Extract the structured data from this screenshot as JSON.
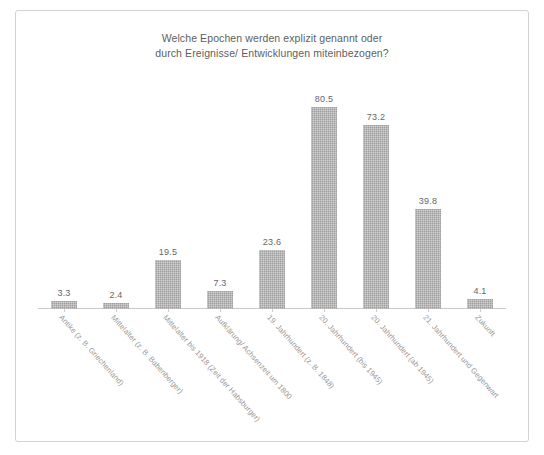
{
  "chart_data": {
    "type": "bar",
    "title": "Welche Epochen werden explizit genannt oder durch Ereignisse/ Entwicklungen miteinbezogen?",
    "title_lines": [
      "Welche Epochen werden explizit genannt oder",
      "durch Ereignisse/ Entwicklungen miteinbezogen?"
    ],
    "categories": [
      "Antike (z. B. Griechenland)",
      "Mittelalter (z. B. Babenberger)",
      "Mittelalter bis 1918 (Zeit der Habsburger)",
      "Aufklärung/ Achsenzeit um 1800",
      "19. Jahrhundert (z. B. 1848)",
      "20. Jahrhundert (bis 1945)",
      "20. Jahrhundert (ab 1945)",
      "21. Jahrhundert und Gegenwart",
      "Zukunft"
    ],
    "values": [
      3.3,
      2.4,
      19.5,
      7.3,
      23.6,
      80.5,
      73.2,
      39.8,
      4.1
    ],
    "value_labels": [
      "3.3",
      "2.4",
      "19.5",
      "7.3",
      "23.6",
      "80.5",
      "73.2",
      "39.8",
      "4.1"
    ],
    "xlabel": "",
    "ylabel": "",
    "ylim": [
      0,
      90
    ],
    "grid": false,
    "legend": false,
    "y_axis_visible": false,
    "bar_color": "#8d8d8d",
    "text_color": "#4a4a4a",
    "border_color": "#d2d2d2",
    "background_color": "#ffffff"
  }
}
